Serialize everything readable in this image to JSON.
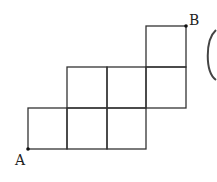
{
  "diagram": {
    "type": "staircase-grid",
    "labels": {
      "start": "A",
      "end": "B"
    },
    "rows": [
      {
        "row": "top",
        "cells": 1,
        "columns": [
          4
        ]
      },
      {
        "row": "middle",
        "cells": 3,
        "columns": [
          2,
          3,
          4
        ]
      },
      {
        "row": "bottom",
        "cells": 3,
        "columns": [
          1,
          2,
          3
        ]
      }
    ],
    "line_color": "#333333",
    "partial_glyph": "("
  }
}
